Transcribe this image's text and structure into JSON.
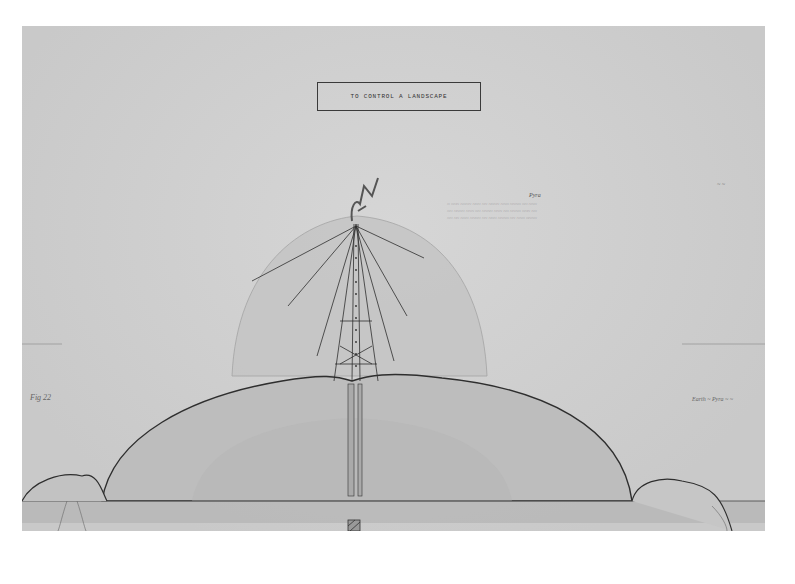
{
  "artwork": {
    "title": "TO CONTROL A LANDSCAPE",
    "note_heading": "Pyra",
    "note_lines": [
      "~ ~~~ ~~~~ ~~~ ~~ ~~~~ ~~~ ~~~~ ~~ ~~~",
      "~~ ~~~~ ~~~ ~~ ~~~~ ~~~ ~~ ~~~~ ~~~ ~~",
      "~~ ~~ ~~~ ~~~~ ~~ ~~~ ~~~~ ~~ ~~~ ~~~~"
    ],
    "figure_label": "Fig 22",
    "right_label": "Earth ~ Pyra ~ ~",
    "corner_mark": "~ ~"
  },
  "colors": {
    "paper": "#cfcfcf",
    "ink": "#2e2e2e",
    "wash": "#bdbdbd"
  }
}
